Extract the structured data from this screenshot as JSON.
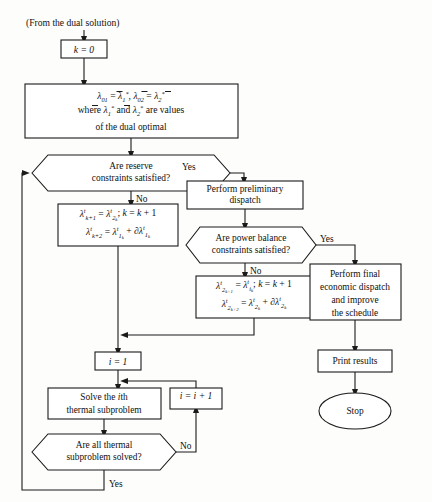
{
  "diagram": {
    "entry_note": "(From the dual solution)",
    "nodes": {
      "init_k": "k = 0",
      "dual_init_line1_a": "λ",
      "dual_init_line1_sub_a": "01",
      "dual_init_eq": " = ",
      "dual_init_line1_b": "λ",
      "dual_init_line1_sub_b": "1",
      "dual_init_line1_c": ", λ",
      "dual_init_line1_sub_c": "02",
      "dual_init_line1_d": " = λ",
      "dual_init_line1_sub_d": "2",
      "dual_init_line2": "where λ",
      "dual_init_line2_mid": " and λ",
      "dual_init_line2_end": " are values",
      "dual_init_line3": "of the dual optimal",
      "reserve_check_line1": "Are reserve",
      "reserve_check_line2": "constraints satisfied?",
      "prelim_dispatch_line1": "Perform preliminary",
      "prelim_dispatch_line2": "dispatch",
      "power_balance_line1": "Are power balance",
      "power_balance_line2": "constraints satisfied?",
      "final_dispatch_line1": "Perform final",
      "final_dispatch_line2": "economic dispatch",
      "final_dispatch_line3": "and improve",
      "final_dispatch_line4": "the schedule",
      "print_results": "Print results",
      "stop": "Stop",
      "set_i": "i = 1",
      "solve_sub_line1_a": "Solve the ",
      "solve_sub_line1_b": "i",
      "solve_sub_line1_c": "th",
      "solve_sub_line2": "thermal subproblem",
      "increment_i": "i = i + 1",
      "all_solved_line1": "Are all thermal",
      "all_solved_line2": "subproblem solved?"
    },
    "lambda_box_1": {
      "line1": "λᵗₖ₊₁ = λᵗ₂ₖ ; k = k + 1",
      "line2": "λᵗₖ₊₂ = λᵗ₁ₖ + ∂λᵗ₁ₖ"
    },
    "lambda_box_2": {
      "line1": "λᵗ₂ₖ₊₁ = λᵗᵢₖ ; k = k + 1",
      "line2": "λᵗ₂ₖ₊₂ = λᵗ₂ₖ + ∂λᵗ₂ₖ"
    },
    "branch_labels": {
      "reserve_yes": "Yes",
      "reserve_no": "No",
      "power_yes": "Yes",
      "power_no": "No",
      "solved_yes": "Yes",
      "solved_no": "No"
    },
    "colors": {
      "stroke": "#1a1a1a",
      "fill": "#ffffff",
      "background": "#fdfdfc",
      "text": "#111111"
    }
  }
}
